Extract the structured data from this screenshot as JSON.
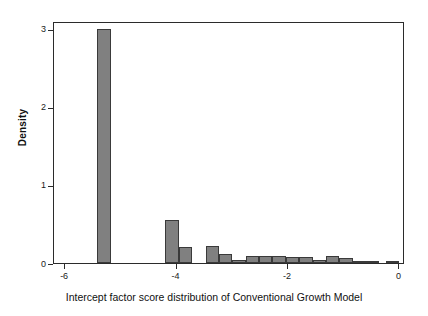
{
  "chart_data": {
    "type": "bar",
    "title": "",
    "subtitle": "",
    "xlabel": "Intercept factor score distribution of Conventional Growth Model",
    "ylabel": "Density",
    "xlim": [
      -6.2,
      0.1
    ],
    "ylim": [
      0,
      3.1
    ],
    "xticks": [
      -6,
      -4,
      -2,
      0
    ],
    "xticklabels": [
      "-6",
      "-4",
      "-2",
      "0"
    ],
    "yticks": [
      0,
      1,
      2,
      3
    ],
    "yticklabels": [
      "0",
      "1",
      "2",
      "3"
    ],
    "grid": false,
    "legend": null,
    "bar_color": "#808080",
    "bar_edge_color": "#3a3a3a",
    "frame_color": "#2b2b2b",
    "bin_width": 0.24,
    "bins": [
      {
        "x_left": -5.42,
        "x_right": -5.18,
        "density": 3.0
      },
      {
        "x_left": -4.2,
        "x_right": -3.96,
        "density": 0.55
      },
      {
        "x_left": -3.96,
        "x_right": -3.72,
        "density": 0.2
      },
      {
        "x_left": -3.48,
        "x_right": -3.24,
        "density": 0.22
      },
      {
        "x_left": -3.24,
        "x_right": -3.0,
        "density": 0.11
      },
      {
        "x_left": -3.0,
        "x_right": -2.76,
        "density": 0.04
      },
      {
        "x_left": -2.76,
        "x_right": -2.52,
        "density": 0.085
      },
      {
        "x_left": -2.52,
        "x_right": -2.28,
        "density": 0.085
      },
      {
        "x_left": -2.28,
        "x_right": -2.04,
        "density": 0.09
      },
      {
        "x_left": -2.04,
        "x_right": -1.8,
        "density": 0.075
      },
      {
        "x_left": -1.8,
        "x_right": -1.56,
        "density": 0.08
      },
      {
        "x_left": -1.56,
        "x_right": -1.32,
        "density": 0.035
      },
      {
        "x_left": -1.32,
        "x_right": -1.08,
        "density": 0.09
      },
      {
        "x_left": -1.08,
        "x_right": -0.84,
        "density": 0.06
      },
      {
        "x_left": -0.84,
        "x_right": -0.6,
        "density": 0.03
      },
      {
        "x_left": -0.6,
        "x_right": -0.36,
        "density": 0.03
      },
      {
        "x_left": -0.24,
        "x_right": -0.0,
        "density": 0.008
      }
    ]
  }
}
